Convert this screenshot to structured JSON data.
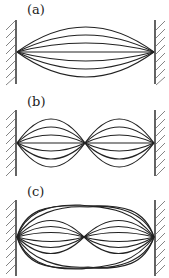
{
  "figure": {
    "panels": [
      {
        "label": "(a)",
        "mode": "fundamental",
        "antinodes": 1,
        "curves": 7
      },
      {
        "label": "(b)",
        "mode": "second harmonic",
        "antinodes": 2,
        "curves": 7
      },
      {
        "label": "(c)",
        "mode": "superposition of first and second harmonics",
        "antinodes": "mixed",
        "curves": 8
      }
    ],
    "colors": {
      "line": "#222222",
      "background": "#ffffff"
    }
  }
}
